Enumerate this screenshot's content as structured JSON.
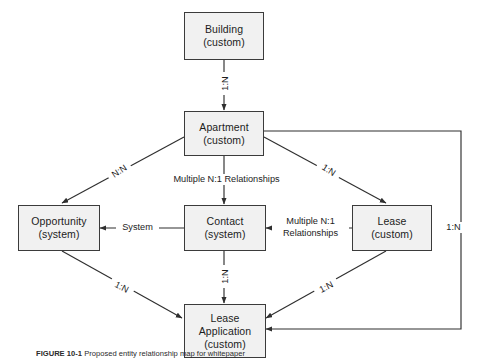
{
  "figure": {
    "caption_label": "FIGURE 10-1",
    "caption_text": "Proposed entity relationship map for whitepaper"
  },
  "entities": [
    {
      "id": "building",
      "name": "Building",
      "kind": "(custom)"
    },
    {
      "id": "apartment",
      "name": "Apartment",
      "kind": "(custom)"
    },
    {
      "id": "opportunity",
      "name": "Opportunity",
      "kind": "(system)"
    },
    {
      "id": "contact",
      "name": "Contact",
      "kind": "(system)"
    },
    {
      "id": "lease",
      "name": "Lease",
      "kind": "(custom)"
    },
    {
      "id": "lease_app",
      "name": "Lease\nApplication",
      "kind": "(custom)",
      "name_line1": "Lease",
      "name_line2": "Application"
    }
  ],
  "relationships": [
    {
      "id": "building-apartment",
      "from": "Building",
      "to": "Apartment",
      "label": "1:N"
    },
    {
      "id": "apartment-opportunity",
      "from": "Apartment",
      "to": "Opportunity",
      "label": "N:N"
    },
    {
      "id": "apartment-contact",
      "from": "Apartment",
      "to": "Contact",
      "label": "Multiple N:1 Relationships"
    },
    {
      "id": "apartment-lease",
      "from": "Apartment",
      "to": "Lease",
      "label": "1:N"
    },
    {
      "id": "apartment-leaseapp",
      "from": "Apartment",
      "to": "Lease Application",
      "label": "1:N"
    },
    {
      "id": "lease-contact",
      "from": "Lease",
      "to": "Contact",
      "label": "Multiple N:1 Relationships",
      "label_line1": "Multiple N:1",
      "label_line2": "Relationships"
    },
    {
      "id": "contact-opportunity",
      "from": "Contact",
      "to": "Opportunity",
      "label": "System"
    },
    {
      "id": "contact-leaseapp",
      "from": "Contact",
      "to": "Lease Application",
      "label": "1:N"
    },
    {
      "id": "opportunity-leaseapp",
      "from": "Opportunity",
      "to": "Lease Application",
      "label": "1:N"
    },
    {
      "id": "lease-leaseapp",
      "from": "Lease",
      "to": "Lease Application",
      "label": "1:N"
    }
  ],
  "style": {
    "box_fill": "#f1f1f1",
    "box_border": "#3b3b3b",
    "line_color": "#2f2f2f",
    "text_color": "#1c1c1c",
    "background": "#ffffff"
  }
}
